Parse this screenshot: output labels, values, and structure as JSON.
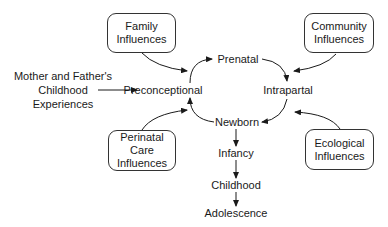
{
  "diagram": {
    "type": "life-course influences cycle",
    "influence_boxes": {
      "family": {
        "lines": [
          "Family",
          "Influences"
        ]
      },
      "community": {
        "lines": [
          "Community",
          "Influences"
        ]
      },
      "perinatal_care": {
        "lines": [
          "Perinatal",
          "Care",
          "Influences"
        ]
      },
      "ecological": {
        "lines": [
          "Ecological",
          "Influences"
        ]
      }
    },
    "external_input": {
      "lines": [
        "Mother and Father's",
        "Childhood",
        "Experiences"
      ]
    },
    "cycle_stages": {
      "preconceptional": "Preconceptional",
      "prenatal": "Prenatal",
      "intrapartal": "Intrapartal",
      "newborn": "Newborn"
    },
    "development_stages": {
      "infancy": "Infancy",
      "childhood": "Childhood",
      "adolescence": "Adolescence"
    },
    "edges": [
      {
        "from": "Family Influences",
        "to": "cycle (upper-left)"
      },
      {
        "from": "Community Influences",
        "to": "cycle (upper-right)"
      },
      {
        "from": "Perinatal Care Influences",
        "to": "cycle (lower-left)"
      },
      {
        "from": "Ecological Influences",
        "to": "cycle (lower-right)"
      },
      {
        "from": "Mother and Father's Childhood Experiences",
        "to": "Preconceptional"
      },
      {
        "from": "Preconceptional",
        "to": "Prenatal"
      },
      {
        "from": "Prenatal",
        "to": "Intrapartal"
      },
      {
        "from": "Intrapartal",
        "to": "Newborn"
      },
      {
        "from": "Newborn",
        "to": "Preconceptional"
      },
      {
        "from": "Newborn",
        "to": "Infancy"
      },
      {
        "from": "Infancy",
        "to": "Childhood"
      },
      {
        "from": "Childhood",
        "to": "Adolescence"
      }
    ],
    "colors": {
      "line": "#1a1a1a",
      "box_border": "#333333",
      "background": "#ffffff"
    }
  }
}
